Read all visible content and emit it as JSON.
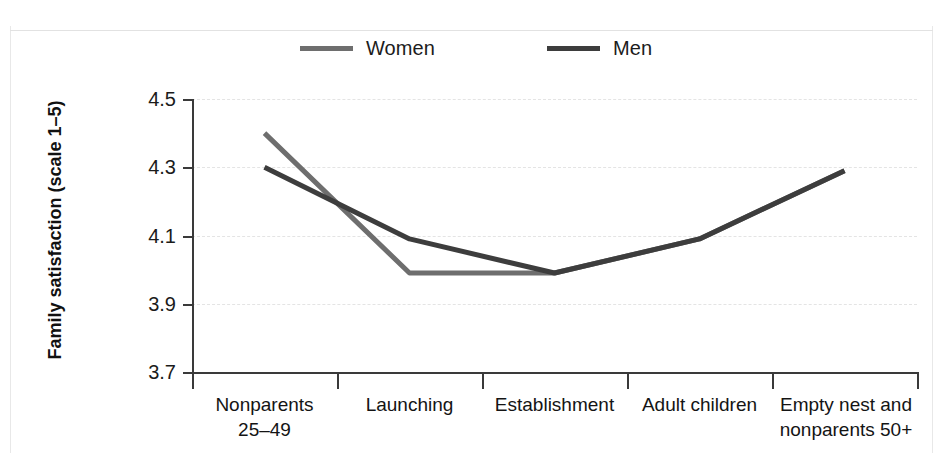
{
  "legend": {
    "items": [
      {
        "label": "Women",
        "color": "#6e6e6e"
      },
      {
        "label": "Men",
        "color": "#3d3d3d"
      }
    ]
  },
  "axes": {
    "y_title": "Family satisfaction (scale 1–5)",
    "y_ticks": [
      "4.5",
      "4.3",
      "4.1",
      "3.9",
      "3.7"
    ]
  },
  "chart_data": {
    "type": "line",
    "title": "",
    "xlabel": "",
    "ylabel": "Family satisfaction (scale 1–5)",
    "ylim": [
      3.7,
      4.5
    ],
    "ytick_values": [
      4.5,
      4.3,
      4.1,
      3.9,
      3.7
    ],
    "grid": true,
    "legend_position": "top",
    "categories": [
      "Nonparents 25–49",
      "Launching",
      "Establishment",
      "Adult children",
      "Empty nest and nonparents 50+"
    ],
    "category_lines": [
      [
        "Nonparents",
        "25–49"
      ],
      [
        "Launching"
      ],
      [
        "Establishment"
      ],
      [
        "Adult children"
      ],
      [
        "Empty nest and",
        "nonparents 50+"
      ]
    ],
    "series": [
      {
        "name": "Women",
        "color": "#6e6e6e",
        "values": [
          4.4,
          3.99,
          3.99,
          4.09,
          4.29
        ]
      },
      {
        "name": "Men",
        "color": "#3d3d3d",
        "values": [
          4.3,
          4.09,
          3.99,
          4.09,
          4.29
        ]
      }
    ]
  }
}
